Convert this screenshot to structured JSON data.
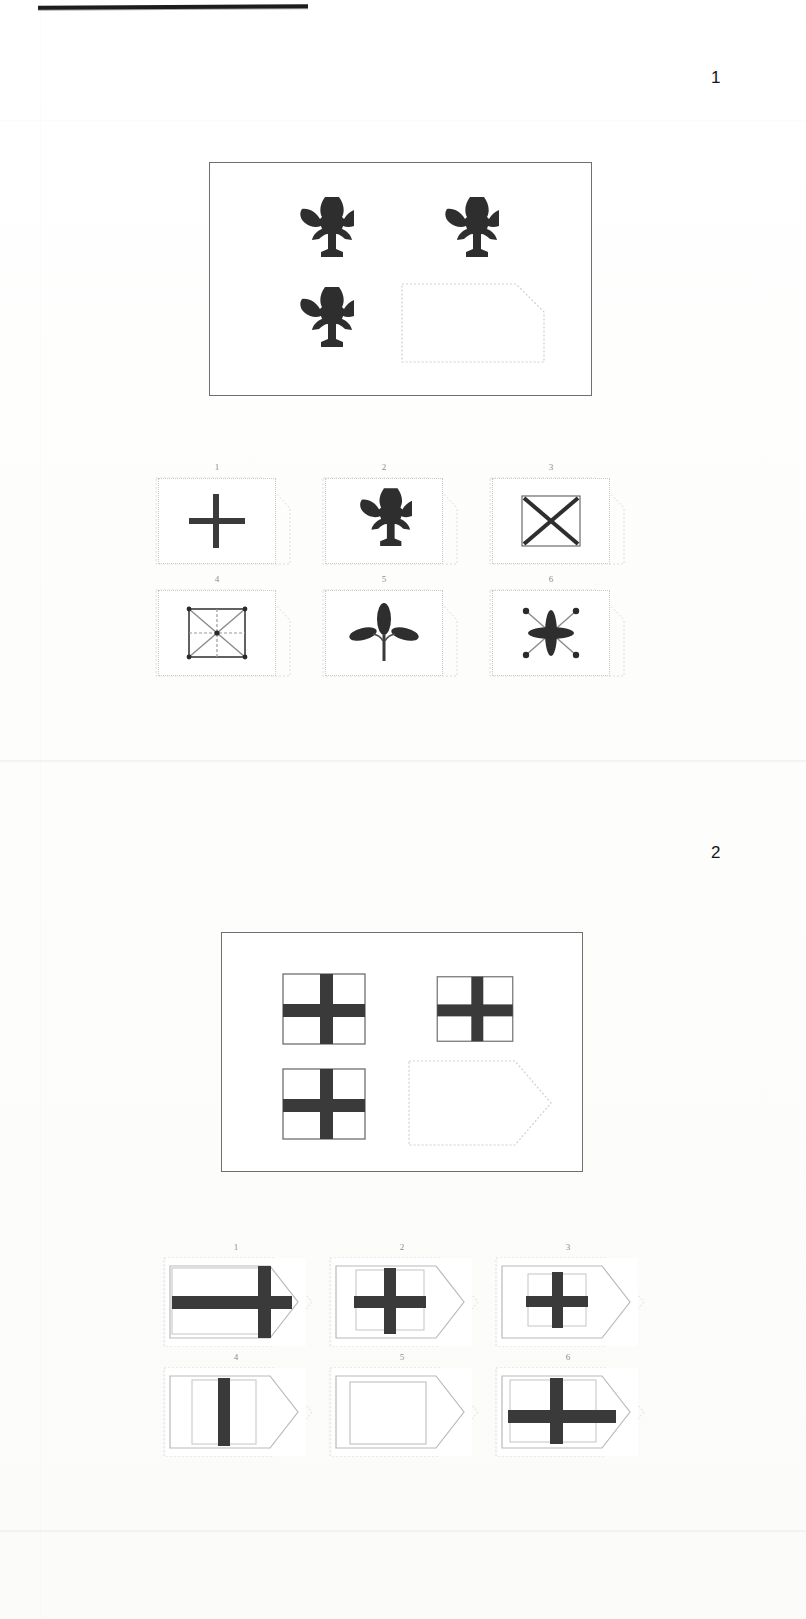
{
  "page": {
    "kind": "non-verbal-reasoning-test-scan",
    "header_rule": true,
    "background_color": "#ffffff",
    "ink_color": "#3a3a3a",
    "faint_outline_color": "#c9c9c9"
  },
  "items": [
    {
      "number": "1",
      "matrix": {
        "rows": 2,
        "cols": 2,
        "cells": [
          {
            "position": "top-left",
            "figure": "fleur-de-lis",
            "filled": true
          },
          {
            "position": "top-right",
            "figure": "fleur-de-lis",
            "filled": true
          },
          {
            "position": "bottom-left",
            "figure": "fleur-de-lis",
            "filled": true
          },
          {
            "position": "bottom-right",
            "figure": "empty-slot",
            "filled": false
          }
        ]
      },
      "options": [
        {
          "label": "1",
          "figure": "plus-cross"
        },
        {
          "label": "2",
          "figure": "fleur-de-lis"
        },
        {
          "label": "3",
          "figure": "square-with-x"
        },
        {
          "label": "4",
          "figure": "square-with-x-and-cross"
        },
        {
          "label": "5",
          "figure": "three-leaf-sprig"
        },
        {
          "label": "6",
          "figure": "eight-point-star-burst"
        }
      ]
    },
    {
      "number": "2",
      "matrix": {
        "rows": 2,
        "cols": 2,
        "cells": [
          {
            "position": "top-left",
            "figure": "cross-in-square",
            "filled": true
          },
          {
            "position": "top-right",
            "figure": "cross-in-square",
            "filled": true
          },
          {
            "position": "bottom-left",
            "figure": "cross-in-square",
            "filled": true
          },
          {
            "position": "bottom-right",
            "figure": "empty-slot",
            "filled": false
          }
        ]
      },
      "options": [
        {
          "label": "1",
          "figure": "wide-cross-offset-right"
        },
        {
          "label": "2",
          "figure": "cross-in-square-small"
        },
        {
          "label": "3",
          "figure": "cross-in-square-small-narrow"
        },
        {
          "label": "4",
          "figure": "vertical-bar-only"
        },
        {
          "label": "5",
          "figure": "empty-square"
        },
        {
          "label": "6",
          "figure": "wide-cross-in-rectangle"
        }
      ]
    }
  ]
}
